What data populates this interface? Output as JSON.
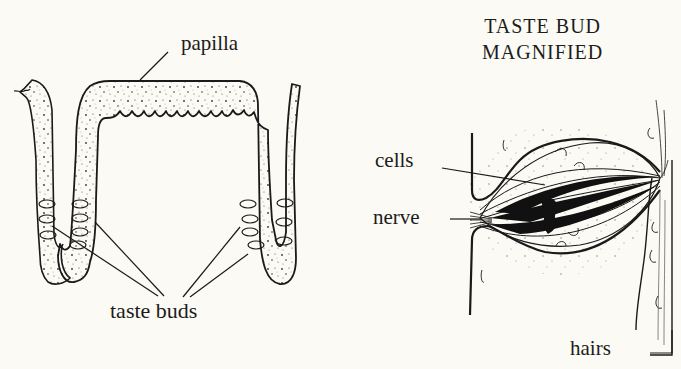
{
  "diagram": {
    "left_panel": {
      "labels": {
        "papilla": "papilla",
        "taste_buds": "taste buds"
      }
    },
    "right_panel": {
      "title_line1": "TASTE BUD",
      "title_line2": "MAGNIFIED",
      "labels": {
        "cells": "cells",
        "nerve": "nerve",
        "hairs": "hairs"
      }
    },
    "colors": {
      "background": "#fbfaf4",
      "ink": "#1a1a1a",
      "stipple": "#3a3a3a"
    }
  }
}
